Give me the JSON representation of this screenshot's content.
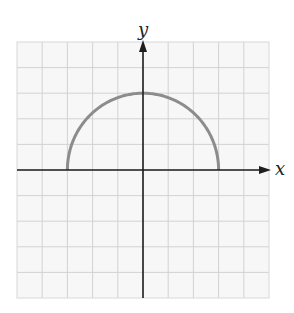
{
  "chart_data": {
    "type": "line",
    "title": "",
    "xlabel": "x",
    "ylabel": "y",
    "xlim": [
      -5,
      5
    ],
    "ylim": [
      -5,
      5
    ],
    "grid": true,
    "grid_step": 1,
    "legend": null,
    "tick_labels": [],
    "series": [
      {
        "name": "upper semicircle",
        "equation": "y = sqrt(9 - x^2)",
        "center": [
          0,
          0
        ],
        "radius": 3,
        "domain": [
          -3,
          3
        ],
        "x": [
          -3,
          -2.5,
          -2,
          -1.5,
          -1,
          -0.5,
          0,
          0.5,
          1,
          1.5,
          2,
          2.5,
          3
        ],
        "y": [
          0,
          1.66,
          2.24,
          2.6,
          2.83,
          2.96,
          3,
          2.96,
          2.83,
          2.6,
          2.24,
          1.66,
          0
        ]
      }
    ]
  },
  "labels": {
    "x_axis": "x",
    "y_axis": "y"
  },
  "colors": {
    "curve": "#8c8c8c",
    "axis": "#1e1e1e",
    "grid": "#d2d2d2",
    "grid_background": "#f7f7f7"
  }
}
